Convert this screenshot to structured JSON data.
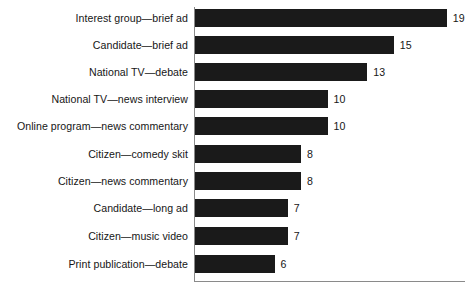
{
  "chart": {
    "title": "",
    "subtitle": "",
    "axis_color": "#8a8a8a",
    "bar_color": "#1a1a1a",
    "text_color": "#161616",
    "background": "#ffffff"
  },
  "chart_data": {
    "type": "bar",
    "orientation": "horizontal",
    "title": "",
    "xlabel": "",
    "ylabel": "",
    "xlim": [
      0,
      20
    ],
    "grid": false,
    "legend": false,
    "categories": [
      "Interest group—brief ad",
      "Candidate—brief ad",
      "National TV—debate",
      "National TV—news interview",
      "Online program—news commentary",
      "Citizen—comedy skit",
      "Citizen—news commentary",
      "Candidate—long ad",
      "Citizen—music video",
      "Print publication—debate"
    ],
    "values": [
      19,
      15,
      13,
      10,
      10,
      8,
      8,
      7,
      7,
      6
    ],
    "value_labels": [
      "19",
      "15",
      "13",
      "10",
      "10",
      "8",
      "8",
      "7",
      "7",
      "6"
    ]
  }
}
